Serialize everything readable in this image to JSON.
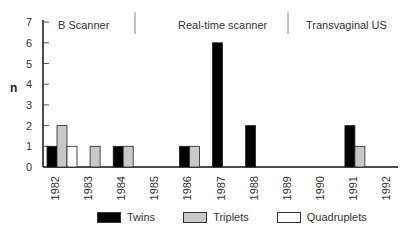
{
  "chart_data": {
    "type": "bar",
    "title": "",
    "xlabel": "",
    "ylabel": "n",
    "ylim": [
      0,
      7
    ],
    "yticks": [
      0,
      1,
      2,
      3,
      4,
      5,
      6,
      7
    ],
    "grid": false,
    "legend_position": "bottom",
    "categories": [
      "1982",
      "1983",
      "1984",
      "1985",
      "1986",
      "1987",
      "1988",
      "1989",
      "1990",
      "1991",
      "1992"
    ],
    "series": [
      {
        "name": "Twins",
        "color": "#000000",
        "values": [
          1,
          0,
          1,
          0,
          1,
          6,
          2,
          0,
          0,
          2,
          0
        ]
      },
      {
        "name": "Triplets",
        "color": "#c8c8c8",
        "values": [
          2,
          1,
          1,
          0,
          1,
          0,
          0,
          0,
          0,
          1,
          0
        ]
      },
      {
        "name": "Quadruplets",
        "color": "#ffffff",
        "values": [
          1,
          0,
          0,
          0,
          0,
          0,
          0,
          0,
          0,
          0,
          0
        ]
      }
    ],
    "annotations": [
      {
        "text": "B Scanner",
        "span": [
          "1982",
          "1985"
        ]
      },
      {
        "text": "Real-time scanner",
        "span": [
          "1985",
          "1989"
        ]
      },
      {
        "text": "Transvaginal US",
        "span": [
          "1989",
          "1992"
        ]
      }
    ]
  },
  "legend": {
    "items": [
      {
        "label": "Twins",
        "color": "#000000"
      },
      {
        "label": "Triplets",
        "color": "#c8c8c8"
      },
      {
        "label": "Quadruplets",
        "color": "#ffffff"
      }
    ]
  },
  "periods": {
    "b_scanner": "B Scanner",
    "real_time": "Real-time scanner",
    "transvaginal": "Transvaginal US"
  },
  "axis": {
    "y_label": "n"
  }
}
